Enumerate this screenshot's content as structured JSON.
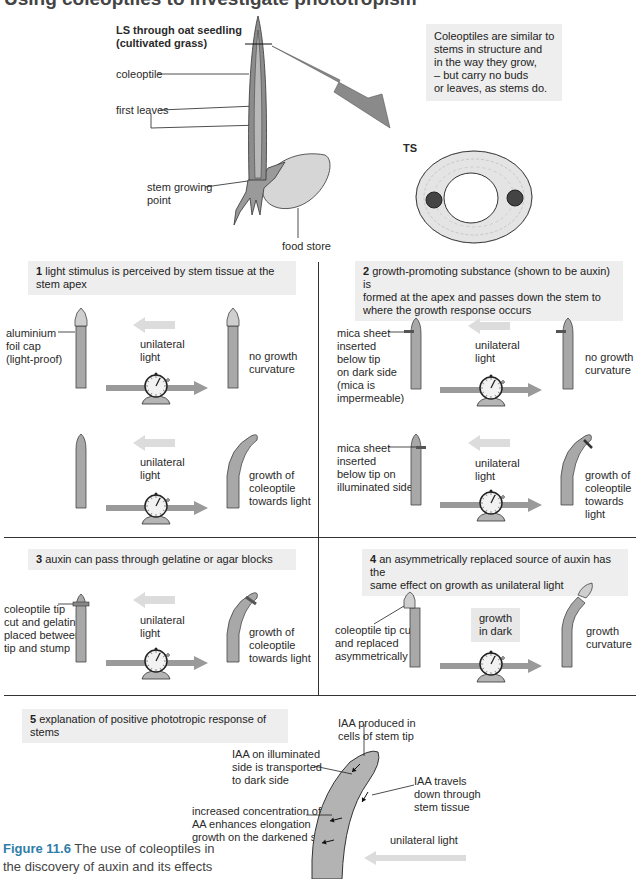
{
  "title": "Using coleoptiles to investigate phototropism",
  "top": {
    "ls_title": "LS through oat seedling\n(cultivated grass)",
    "labels": {
      "coleoptile": "coleoptile",
      "first_leaves": "first leaves",
      "stem_growing_point": "stem growing\npoint",
      "food_store": "food store",
      "ts": "TS"
    },
    "note": "Coleoptiles are similar to\nstems in structure and\nin the way they grow,\n– but carry no buds\nor leaves, as stems do."
  },
  "panels": [
    {
      "number": "1",
      "heading": "light stimulus is perceived by stem tissue at the stem apex",
      "rows": [
        {
          "left_label": "aluminium\nfoil cap\n(light-proof)",
          "middle_label": "unilateral\nlight",
          "result_label": "no growth\ncurvature"
        },
        {
          "left_label": "",
          "middle_label": "unilateral\nlight",
          "result_label": "growth of\ncoleoptile\ntowards light"
        }
      ]
    },
    {
      "number": "2",
      "heading": "growth-promoting substance (shown to be auxin) is\nformed at the apex and passes down the stem to\nwhere the growth response occurs",
      "rows": [
        {
          "left_label": "mica sheet\ninserted\nbelow tip\non dark side\n(mica is\nimpermeable)",
          "middle_label": "unilateral\nlight",
          "result_label": "no growth\ncurvature"
        },
        {
          "left_label": "mica sheet\ninserted\nbelow tip on\nilluminated side",
          "middle_label": "unilateral\nlight",
          "result_label": "growth of\ncoleoptile\ntowards light"
        }
      ]
    },
    {
      "number": "3",
      "heading": "auxin can pass through gelatine or agar blocks",
      "rows": [
        {
          "left_label": "coleoptile tip\ncut and gelatin\nplaced between\ntip and stump",
          "middle_label": "unilateral\nlight",
          "result_label": "growth of\ncoleoptile\ntowards light"
        }
      ]
    },
    {
      "number": "4",
      "heading": "an asymmetrically replaced source of auxin has the\nsame effect on growth as unilateral light",
      "rows": [
        {
          "left_label": "coleoptile tip cut\nand replaced\nasymmetrically",
          "middle_label": "growth\nin dark",
          "result_label": "growth\ncurvature"
        }
      ]
    },
    {
      "number": "5",
      "heading": "explanation of positive phototropic response of stems",
      "labels": {
        "iaa_produced": "IAA produced in\ncells of stem tip",
        "iaa_illuminated": "IAA on illuminated\nside is transported\nto dark side",
        "iaa_travels": "IAA travels\ndown through\nstem tissue",
        "increased_conc": "increased concentration of\nAA enhances elongation\ngrowth on the darkened side",
        "unilateral_light": "unilateral light"
      }
    }
  ],
  "caption": {
    "figure_number": "Figure 11.6",
    "text": " The use of coleoptiles in\nthe discovery of auxin and its effects"
  },
  "colors": {
    "coleoptile_fill": "#a8a8a8",
    "tip_fill": "#cfcfcf",
    "header_bg": "#eeeeee",
    "caption_accent": "#2e7ea7",
    "light_arrow": "#dcdcdc",
    "time_arrow": "#9a9a9a"
  }
}
